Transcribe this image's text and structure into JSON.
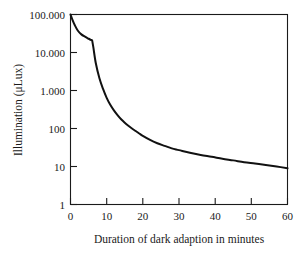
{
  "chart_data": {
    "type": "line",
    "title": "",
    "xlabel": "Duration of dark adaption in minutes",
    "ylabel": "Illumination (μLux)",
    "xlim": [
      0,
      60
    ],
    "ylim": [
      1,
      100000
    ],
    "yscale": "log",
    "xscale": "linear",
    "grid": false,
    "legend": null,
    "xticks": [
      0,
      10,
      20,
      30,
      40,
      50,
      60
    ],
    "xtick_labels": [
      "0",
      "10",
      "20",
      "30",
      "40",
      "50",
      "60"
    ],
    "yticks": [
      1,
      10,
      100,
      1000,
      10000,
      100000
    ],
    "ytick_labels": [
      "1",
      "10",
      "100",
      "1.000",
      "10.000",
      "100.000"
    ],
    "series": [
      {
        "name": "Illumination during dark adaption",
        "x": [
          0,
          0.6,
          1.2,
          2,
          3,
          4,
          5,
          5.6,
          6,
          6.3,
          7,
          8,
          9,
          10,
          11,
          12,
          13,
          14,
          15,
          16,
          17,
          18,
          19,
          20,
          22,
          24,
          26,
          28,
          30,
          33,
          36,
          39,
          42,
          45,
          48,
          51,
          54,
          57,
          60
        ],
        "y": [
          100000,
          70000,
          52000,
          38000,
          30000,
          26000,
          23000,
          21500,
          20500,
          14000,
          5200,
          2100,
          1100,
          640,
          420,
          300,
          225,
          175,
          142,
          118,
          100,
          86,
          74,
          64,
          50,
          41,
          35,
          30,
          27,
          23,
          20,
          18,
          16,
          14.5,
          13,
          12,
          11,
          10,
          9
        ]
      }
    ],
    "annotations": [
      {
        "text": "shoulder / kink in decay curve",
        "x": 6,
        "y": 20500
      }
    ]
  },
  "axes": {
    "y_axis_title": "Illumination (μLux)",
    "x_axis_title": "Duration of dark adaption in minutes"
  }
}
